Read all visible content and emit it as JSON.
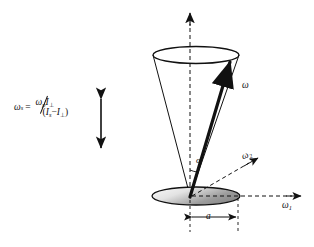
{
  "figure": {
    "type": "physics-vector-diagram"
  },
  "formula": {
    "lhs_symbol": "ω",
    "lhs_sub": "s",
    "equals": "=",
    "numerator_symbol": "ω",
    "numerator_sub": "p",
    "numerator_inertia": "I",
    "numerator_inertia_sub": "⊥",
    "denominator_open": "(",
    "denominator_first": "I",
    "denominator_first_sub": "s",
    "denominator_minus": "−",
    "denominator_second": "I",
    "denominator_second_sub": "⊥",
    "denominator_close": ")",
    "plain_text": "ωs = ωp I⊥ / (Is − I⊥)"
  },
  "labels": {
    "omega": {
      "symbol": "ω",
      "sub": ""
    },
    "omega2": {
      "symbol": "ω",
      "sub": "2"
    },
    "omega1": {
      "symbol": "ω",
      "sub": "1"
    },
    "alpha": {
      "symbol": "α"
    },
    "radius": {
      "symbol": "a"
    }
  },
  "colors": {
    "stroke": "#111111",
    "disk_fill_light": "#f2f2f2",
    "disk_fill_dark": "#8d8d8d",
    "background": "#ffffff"
  },
  "geometry": {
    "apex": {
      "x": 190,
      "y": 196
    },
    "cone_top_ellipse": {
      "cx": 196,
      "cy": 55,
      "rx": 43,
      "ry": 8
    },
    "disk_ellipse": {
      "cx": 196,
      "cy": 196,
      "rx": 44,
      "ry": 9
    },
    "omega_vector_tip": {
      "x": 233,
      "y": 55
    },
    "vertical_axis_top": {
      "x": 190,
      "y": 12
    },
    "omega1_axis_end": {
      "x": 300,
      "y": 196
    },
    "omega2_arrow_end": {
      "x": 256,
      "y": 158
    }
  }
}
